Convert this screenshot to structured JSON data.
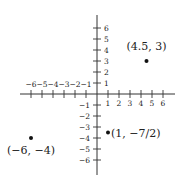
{
  "chart_data": {
    "type": "scatter",
    "title": "",
    "xlabel": "",
    "ylabel": "",
    "xlim": [
      -6,
      6
    ],
    "ylim": [
      -6,
      6
    ],
    "grid": false,
    "x_ticks": [
      -6,
      -5,
      -4,
      -3,
      -2,
      -1,
      1,
      2,
      3,
      4,
      5,
      6
    ],
    "y_ticks": [
      -6,
      -5,
      -4,
      -3,
      -2,
      -1,
      1,
      2,
      3,
      4,
      5,
      6
    ],
    "x_tick_labels": [
      "−6",
      "−5",
      "−4",
      "−3",
      "−2",
      "−1",
      "1",
      "2",
      "3",
      "4",
      "5",
      "6"
    ],
    "y_tick_labels": [
      "−6",
      "−5",
      "−4",
      "−3",
      "−2",
      "−1",
      "1",
      "2",
      "3",
      "4",
      "5",
      "6"
    ],
    "points": [
      {
        "x": 4.5,
        "y": 3,
        "label": "(4.5, 3)"
      },
      {
        "x": -6,
        "y": -4,
        "label": "(−6, −4)"
      },
      {
        "x": 1,
        "y": -3.5,
        "label": "(1, −7/2)"
      }
    ]
  },
  "style": {
    "axis_color": "#333333",
    "point_color": "#111111"
  }
}
